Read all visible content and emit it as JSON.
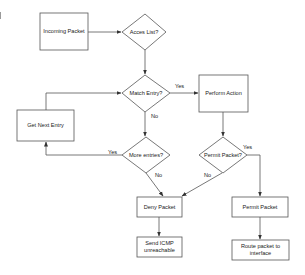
{
  "diagram": {
    "type": "flowchart",
    "colors": {
      "stroke": "#555555",
      "fill": "#ffffff",
      "text": "#222222"
    },
    "nodes": {
      "incoming_packet": {
        "shape": "rect",
        "label": "Incoming Packet"
      },
      "acces_list": {
        "shape": "diamond",
        "label": "Acces List?"
      },
      "match_entry": {
        "shape": "diamond",
        "label": "Match Entry?"
      },
      "perform_action": {
        "shape": "rect",
        "label": "Perform Action"
      },
      "get_next_entry": {
        "shape": "rect",
        "label": "Get Next Entry"
      },
      "more_entries": {
        "shape": "diamond",
        "label": "More entries?"
      },
      "permit_packet_decision": {
        "shape": "diamond",
        "label": "Permit Packet?"
      },
      "deny_packet": {
        "shape": "rect",
        "label": "Deny Packet"
      },
      "permit_packet": {
        "shape": "rect",
        "label": "Permit Packet"
      },
      "send_icmp": {
        "shape": "rect",
        "label": "Send ICMP unreachable"
      },
      "route_packet": {
        "shape": "rect",
        "label": "Route packet to interface"
      }
    },
    "edges": [
      {
        "from": "incoming_packet",
        "to": "acces_list",
        "label": ""
      },
      {
        "from": "acces_list",
        "to": "match_entry",
        "label": ""
      },
      {
        "from": "match_entry",
        "to": "perform_action",
        "label": "Yes"
      },
      {
        "from": "match_entry",
        "to": "more_entries",
        "label": "No"
      },
      {
        "from": "more_entries",
        "to": "get_next_entry",
        "label": "Yes"
      },
      {
        "from": "get_next_entry",
        "to": "match_entry",
        "label": ""
      },
      {
        "from": "more_entries",
        "to": "deny_packet",
        "label": "No"
      },
      {
        "from": "perform_action",
        "to": "permit_packet_decision",
        "label": ""
      },
      {
        "from": "permit_packet_decision",
        "to": "permit_packet",
        "label": "Yes"
      },
      {
        "from": "permit_packet_decision",
        "to": "deny_packet",
        "label": "No"
      },
      {
        "from": "deny_packet",
        "to": "send_icmp",
        "label": ""
      },
      {
        "from": "permit_packet",
        "to": "route_packet",
        "label": ""
      }
    ],
    "edge_labels": {
      "match_yes": "Yes",
      "match_no": "No",
      "more_yes": "Yes",
      "more_no": "No",
      "permit_yes": "Yes",
      "permit_no": "No"
    }
  }
}
